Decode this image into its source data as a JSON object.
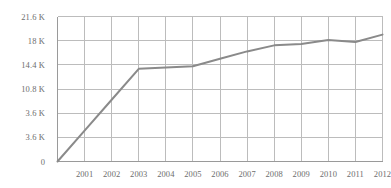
{
  "chart_data": {
    "type": "line",
    "title": "",
    "subtitle": "",
    "xlabel": "",
    "ylabel": "",
    "grid": true,
    "legend": false,
    "legend_position": "none",
    "line_color": "#8a8a8a",
    "grid_color": "#bcbcbc",
    "axis_color": "#9a9a9a",
    "tick_label_color": "#6d6d6d",
    "x": [
      2000,
      2001,
      2002,
      2003,
      2004,
      2005,
      2006,
      2007,
      2008,
      2009,
      2010,
      2011,
      2012
    ],
    "values": [
      0,
      4600,
      9200,
      13800,
      14000,
      14200,
      15300,
      16400,
      17300,
      17500,
      18100,
      17800,
      18900
    ],
    "xlim": [
      2000,
      2012
    ],
    "ylim": [
      0,
      21600
    ],
    "x_tick_labels": [
      "2001",
      "2002",
      "2003",
      "2004",
      "2005",
      "2006",
      "2007",
      "2008",
      "2009",
      "2010",
      "2011",
      "2012"
    ],
    "x_tick_values": [
      2001,
      2002,
      2003,
      2004,
      2005,
      2006,
      2007,
      2008,
      2009,
      2010,
      2011,
      2012
    ],
    "y_tick_labels": [
      "21.6 K",
      "18 K",
      "14.4 K",
      "10.8 K",
      "3.6 K",
      "3.6 K",
      "0"
    ],
    "y_tick_values": [
      21600,
      18000,
      14400,
      10800,
      7200,
      3600,
      0
    ]
  }
}
